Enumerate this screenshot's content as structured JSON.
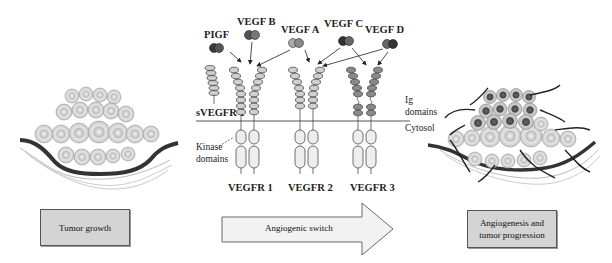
{
  "ligands": {
    "pigf": "PIGF",
    "vegf_b": "VEGF B",
    "vegf_a": "VEGF A",
    "vegf_c": "VEGF C",
    "vegf_d": "VEGF D"
  },
  "receptors": {
    "svegfr1": "sVEGFR 1",
    "vegfr1": "VEGFR 1",
    "vegfr2": "VEGFR 2",
    "vegfr3": "VEGFR 3"
  },
  "annotations": {
    "ig_domains_line1": "Ig",
    "ig_domains_line2": "domains",
    "cytosol": "Cytosol",
    "kinase_line1": "Kinase",
    "kinase_line2": "domains"
  },
  "stages": {
    "left_box": "Tumor growth",
    "arrow": "Angiogenic switch",
    "right_box_line1": "Angiogenesis and",
    "right_box_line2": "tumor progression"
  },
  "colors": {
    "light_cell": "#d9d9d9",
    "dark_cell": "#5a5a5a",
    "box_fill": "#d4d4d4",
    "arrow_fill": "#f2f2f2",
    "vessel": "#333333"
  }
}
